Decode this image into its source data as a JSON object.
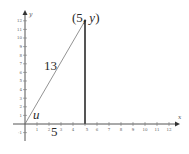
{
  "diagram": {
    "type": "right-triangle-on-coordinate-plane",
    "x_axis": {
      "label": "x",
      "ticks": [
        "1",
        "2",
        "3",
        "4",
        "5",
        "6",
        "7",
        "8",
        "9",
        "10",
        "11",
        "12"
      ]
    },
    "y_axis": {
      "label": "y",
      "ticks": [
        "-1",
        "1",
        "2",
        "3",
        "4",
        "5",
        "6",
        "7",
        "8",
        "9",
        "10",
        "11",
        "12"
      ]
    },
    "labels": {
      "point": "(5, y)",
      "point_open": "(5, ",
      "point_var": "y",
      "point_close": ")",
      "hypotenuse": "13",
      "base": "5",
      "angle": "u"
    },
    "colors": {
      "axis": "#555555",
      "hypotenuse": "#777777",
      "vertical_side": "#555555"
    }
  }
}
